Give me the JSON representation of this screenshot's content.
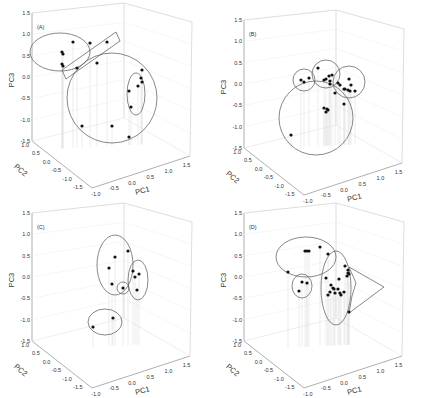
{
  "figure": {
    "panels": [
      "A",
      "B",
      "C",
      "D"
    ]
  },
  "axes": {
    "x_label": "PC1",
    "y_label": "PC2",
    "z_label": "PC3",
    "z_ticks": [
      "1.5",
      "1.0",
      "0.5",
      "0.0",
      "-0.5",
      "-1.0",
      "-1.5"
    ],
    "pc2_ticks": [
      "1.0",
      "0.5",
      "0.0",
      "-0.5",
      "-1.0",
      "-1.5"
    ],
    "pc1_ticks": [
      "-1.0",
      "-0.5",
      "0.0",
      "0.5",
      "1.0",
      "1.5"
    ]
  },
  "chart_data": [
    {
      "type": "scatter",
      "subtype": "3d-scatter",
      "panel_label": "(A)",
      "xlabel": "PC1",
      "ylabel": "PC2",
      "zlabel": "PC3",
      "xlim": [
        -1.0,
        1.5
      ],
      "ylim": [
        -1.5,
        1.0
      ],
      "zlim": [
        -1.5,
        1.5
      ],
      "grid": true,
      "screen_points": [
        [
          62,
          52
        ],
        [
          73,
          42
        ],
        [
          63,
          54
        ],
        [
          62,
          64
        ],
        [
          63,
          66
        ],
        [
          90,
          43
        ],
        [
          107,
          42
        ],
        [
          97,
          63
        ],
        [
          77,
          68
        ],
        [
          129,
          137
        ],
        [
          112,
          126
        ],
        [
          82,
          126
        ],
        [
          142,
          70
        ],
        [
          141,
          78
        ],
        [
          142,
          82
        ],
        [
          138,
          86
        ],
        [
          129,
          91
        ],
        [
          131,
          107
        ]
      ],
      "groups": [
        {
          "shape": "ellipse",
          "cx": 60,
          "cy": 52,
          "rx": 30,
          "ry": 19
        },
        {
          "shape": "rectangle",
          "points": [
            [
              62,
              70
            ],
            [
              116,
              32
            ],
            [
              120,
              41
            ],
            [
              66,
              79
            ]
          ]
        },
        {
          "shape": "circle",
          "cx": 112,
          "cy": 98,
          "r": 45
        },
        {
          "shape": "ellipse",
          "cx": 136,
          "cy": 94,
          "rx": 9,
          "ry": 21
        }
      ]
    },
    {
      "type": "scatter",
      "subtype": "3d-scatter",
      "panel_label": "(B)",
      "xlabel": "PC1",
      "ylabel": "PC2",
      "zlabel": "PC3",
      "xlim": [
        -1.0,
        1.5
      ],
      "ylim": [
        -1.5,
        1.0
      ],
      "zlim": [
        -1.5,
        1.5
      ],
      "grid": true,
      "screen_points": [
        [
          301,
          80
        ],
        [
          304,
          82
        ],
        [
          309,
          78
        ],
        [
          318,
          68
        ],
        [
          324,
          80
        ],
        [
          326,
          79
        ],
        [
          329,
          76
        ],
        [
          332,
          75
        ],
        [
          330,
          81
        ],
        [
          330,
          84
        ],
        [
          338,
          83
        ],
        [
          340,
          85
        ],
        [
          349,
          79
        ],
        [
          351,
          85
        ],
        [
          344,
          89
        ],
        [
          345,
          89
        ],
        [
          348,
          90
        ],
        [
          350,
          91
        ],
        [
          355,
          91
        ],
        [
          335,
          93
        ],
        [
          344,
          104
        ],
        [
          324,
          108
        ],
        [
          327,
          109
        ],
        [
          328,
          110
        ],
        [
          326,
          112
        ],
        [
          291,
          135
        ]
      ],
      "groups": [
        {
          "shape": "circle",
          "cx": 304,
          "cy": 80,
          "r": 11
        },
        {
          "shape": "circle",
          "cx": 326,
          "cy": 74,
          "r": 14
        },
        {
          "shape": "circle",
          "cx": 349,
          "cy": 82,
          "r": 16
        },
        {
          "shape": "circle",
          "cx": 316,
          "cy": 118,
          "r": 37
        }
      ]
    },
    {
      "type": "scatter",
      "subtype": "3d-scatter",
      "panel_label": "(C)",
      "xlabel": "PC1",
      "ylabel": "PC2",
      "zlabel": "PC3",
      "xlim": [
        -1.0,
        1.5
      ],
      "ylim": [
        -1.5,
        1.0
      ],
      "zlim": [
        -1.5,
        1.5
      ],
      "grid": true,
      "screen_points": [
        [
          128,
          251
        ],
        [
          115,
          257
        ],
        [
          109,
          268
        ],
        [
          112,
          284
        ],
        [
          133,
          271
        ],
        [
          135,
          277
        ],
        [
          139,
          274
        ],
        [
          137,
          290
        ],
        [
          123,
          288
        ],
        [
          113,
          318
        ],
        [
          93,
          327
        ]
      ],
      "groups": [
        {
          "shape": "ellipse",
          "cx": 115,
          "cy": 265,
          "rx": 18,
          "ry": 30
        },
        {
          "shape": "ellipse",
          "cx": 138,
          "cy": 280,
          "rx": 10,
          "ry": 20
        },
        {
          "shape": "circle",
          "cx": 123,
          "cy": 288,
          "r": 6
        },
        {
          "shape": "ellipse",
          "cx": 105,
          "cy": 322,
          "rx": 17,
          "ry": 13
        }
      ]
    },
    {
      "type": "scatter",
      "subtype": "3d-scatter",
      "panel_label": "(D)",
      "xlabel": "PC1",
      "ylabel": "PC2",
      "zlabel": "PC3",
      "xlim": [
        -1.0,
        1.5
      ],
      "ylim": [
        -1.5,
        1.0
      ],
      "zlim": [
        -1.5,
        1.5
      ],
      "grid": true,
      "screen_points": [
        [
          305,
          251
        ],
        [
          307,
          251
        ],
        [
          309,
          251
        ],
        [
          320,
          247
        ],
        [
          328,
          254
        ],
        [
          288,
          272
        ],
        [
          302,
          282
        ],
        [
          307,
          283
        ],
        [
          299,
          291
        ],
        [
          345,
          266
        ],
        [
          348,
          270
        ],
        [
          348,
          273
        ],
        [
          349,
          274
        ],
        [
          347,
          276
        ],
        [
          326,
          278
        ],
        [
          339,
          279
        ],
        [
          331,
          285
        ],
        [
          333,
          288
        ],
        [
          334,
          289
        ],
        [
          338,
          289
        ],
        [
          330,
          292
        ],
        [
          335,
          293
        ],
        [
          340,
          293
        ],
        [
          341,
          295
        ],
        [
          344,
          292
        ],
        [
          328,
          295
        ],
        [
          349,
          312
        ]
      ],
      "groups": [
        {
          "shape": "ellipse",
          "cx": 306,
          "cy": 257,
          "rx": 30,
          "ry": 20
        },
        {
          "shape": "ellipse",
          "cx": 302,
          "cy": 286,
          "rx": 10,
          "ry": 12
        },
        {
          "shape": "ellipse",
          "cx": 336,
          "cy": 288,
          "rx": 15,
          "ry": 37
        },
        {
          "shape": "polygon",
          "points": [
            [
              349,
              267
            ],
            [
              384,
              287
            ],
            [
              349,
              313
            ],
            [
              352,
              296
            ],
            [
              356,
              283
            ]
          ]
        }
      ]
    }
  ]
}
